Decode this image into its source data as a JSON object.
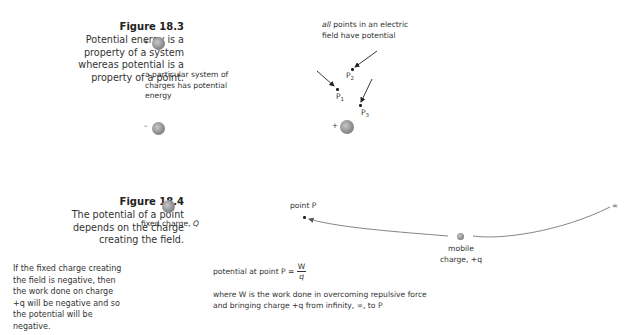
{
  "figure_18_3": {
    "title": "Figure 18.3",
    "caption_lines": [
      "Potential energy is a",
      "property of a system",
      "whereas potential is a",
      "property of a point."
    ],
    "left_diagram": {
      "top_charge_sign": "+",
      "bottom_charge_sign": "–",
      "note_lines": [
        "a particular system of",
        "charges has potential",
        "energy"
      ]
    },
    "right_diagram": {
      "note_italic": "all",
      "note_line1_rest": " points in an electric",
      "note_line2": "field have potential",
      "points": [
        {
          "label": "P",
          "sub": "1"
        },
        {
          "label": "P",
          "sub": "2"
        },
        {
          "label": "P",
          "sub": "3"
        }
      ],
      "charge_sign": "+"
    }
  },
  "figure_18_4": {
    "title": "Figure 18.4",
    "caption_lines": [
      "The potential of a point",
      "depends on the charge",
      "creating the field."
    ],
    "side_note_lines": [
      "If the fixed charge creating",
      "the field is negative, then",
      "the work done on charge",
      "+q will be negative and so",
      "the potential will be",
      "negative."
    ],
    "fixed_charge_label": "fixed charge, ",
    "fixed_charge_symbol": "Q",
    "point_label": "point P",
    "mobile_charge_line1": "mobile",
    "mobile_charge_line2": "charge, +q",
    "infinity_symbol": "∞",
    "formula_prefix": "potential at point P = ",
    "formula_numerator": "W",
    "formula_denominator": "q",
    "explanation_line1": "where W is the work done in overcoming repulsive force",
    "explanation_line2": "and bringing charge +q from infinity, ∞, to P"
  }
}
